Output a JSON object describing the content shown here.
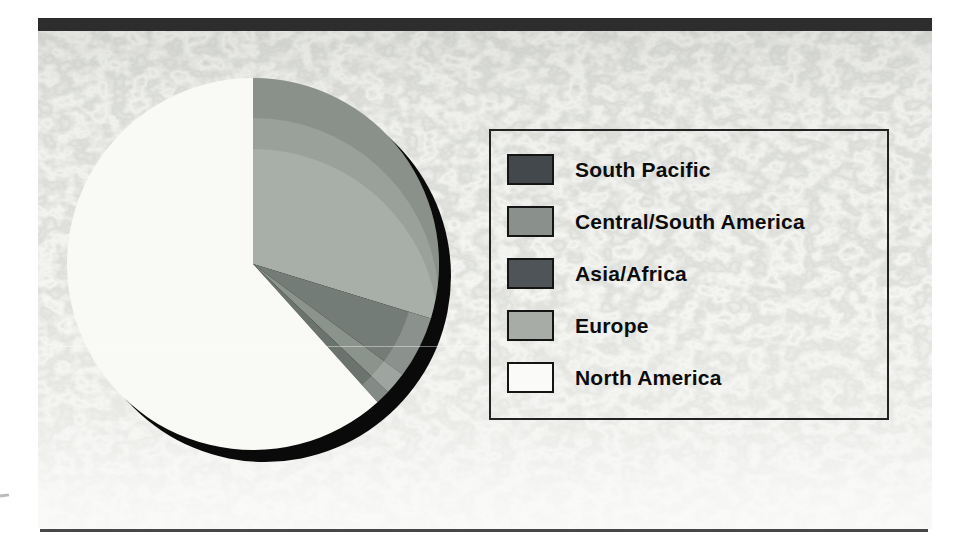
{
  "figure": {
    "kind": "scanned textbook pie chart figure",
    "top_bar_color": "#2d2d2d",
    "bottom_rule_color": "#474747",
    "panel_texture_base": "#c6c7c3"
  },
  "legend": {
    "items": [
      {
        "label": "South Pacific",
        "color": "#42484b"
      },
      {
        "label": "Central/South America",
        "color": "#8a908c"
      },
      {
        "label": "Asia/Africa",
        "color": "#4e5457"
      },
      {
        "label": "Europe",
        "color": "#a7aca7"
      },
      {
        "label": "North America",
        "color": "#fafaf8"
      }
    ]
  },
  "chart_data": {
    "type": "pie",
    "title": "",
    "legend_position": "right",
    "start_angle_deg": 0,
    "direction": "clockwise",
    "slices": [
      {
        "label": "Europe",
        "value_pct": 29.7,
        "angle_deg": 107.0,
        "color": "#a8afa9"
      },
      {
        "label": "Asia/Africa",
        "value_pct": 5.4,
        "angle_deg": 19.5,
        "color": "#747c77"
      },
      {
        "label": "Central/South America",
        "value_pct": 1.9,
        "angle_deg": 7.0,
        "color": "#8b938d"
      },
      {
        "label": "South Pacific",
        "value_pct": 1.3,
        "angle_deg": 4.5,
        "color": "#6b736e"
      },
      {
        "label": "North America",
        "value_pct": 61.7,
        "angle_deg": 222.0,
        "color": "#f9f9f6"
      }
    ],
    "effects": {
      "shadow_color": "#0a0a0a",
      "bevel_color_wide": "rgba(30,40,34,0.10)",
      "bevel_color_rim": "rgba(30,40,34,0.13)",
      "rim_highlight_color": "rgba(255,255,255,0.17)"
    }
  }
}
